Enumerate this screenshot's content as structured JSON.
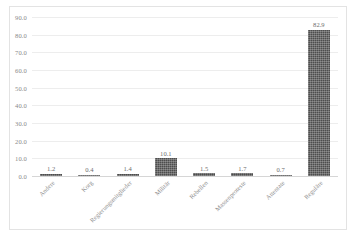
{
  "chart_data": {
    "type": "bar",
    "title": "",
    "subtitle": "",
    "xlabel": "",
    "ylabel": "",
    "categories": [
      "Andere",
      "Korg",
      "Regierungsmitglieder",
      "Militär",
      "Rebellen",
      "Massenproteste",
      "Attentate",
      "Reguläre"
    ],
    "values": [
      1.2,
      0.4,
      1.4,
      10.1,
      1.5,
      1.7,
      0.7,
      82.9
    ],
    "value_labels": [
      "1.2",
      "0.4",
      "1.4",
      "10.1",
      "1.5",
      "1.7",
      "0.7",
      "82.9"
    ],
    "ylim": [
      0.0,
      90.0
    ],
    "ytick_values": [
      0.0,
      10.0,
      20.0,
      30.0,
      40.0,
      50.0,
      60.0,
      70.0,
      80.0,
      90.0
    ],
    "ytick_labels": [
      "0.0",
      "10.0",
      "20.0",
      "30.0",
      "40.0",
      "50.0",
      "60.0",
      "70.0",
      "80.0",
      "90.0"
    ],
    "grid": true,
    "grid_axis": "y",
    "legend": false,
    "legend_position": "none",
    "series": [
      {
        "name": "",
        "values": [
          1.2,
          0.4,
          1.4,
          10.1,
          1.5,
          1.7,
          0.7,
          82.9
        ]
      }
    ],
    "bar_color": "#4d4d4d",
    "grid_color": "#ededed",
    "axis_label_color": "#8a8a8a",
    "frame_color": "#e3e3e3",
    "background_color": "#ffffff",
    "x_label_rotation_degrees": -45
  }
}
